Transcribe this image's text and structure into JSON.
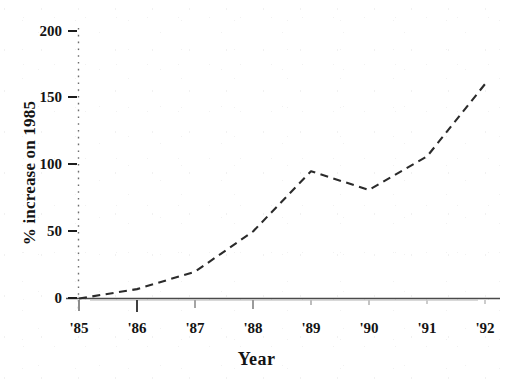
{
  "chart_data": {
    "type": "line",
    "title": "",
    "xlabel": "Year",
    "ylabel": "% increase on 1985",
    "categories": [
      "'85",
      "'86",
      "'87",
      "'88",
      "'89",
      "'90",
      "'91",
      "'92"
    ],
    "values": [
      0,
      7,
      20,
      50,
      95,
      81,
      106,
      160
    ],
    "series": [
      {
        "name": "% increase on 1985",
        "values": [
          0,
          7,
          20,
          50,
          95,
          81,
          106,
          160
        ],
        "line_style": "dashed",
        "color": "#2b2b2b"
      }
    ],
    "xlim": [
      "'85",
      "'92"
    ],
    "ylim": [
      0,
      200
    ],
    "yticks": [
      0,
      50,
      100,
      150,
      200
    ],
    "ytick_labels": [
      "0",
      "50",
      "100",
      "150",
      "200"
    ],
    "xticks": [
      "'85",
      "'86",
      "'87",
      "'88",
      "'89",
      "'90",
      "'91",
      "'92"
    ],
    "grid": false,
    "legend": "none",
    "y_axis_style": "dotted",
    "x_axis_style": "solid",
    "annotations": []
  },
  "axes": {
    "y_title": "% increase on 1985",
    "x_title": "Year",
    "y_tick_labels": [
      "200",
      "150",
      "100",
      "50",
      "0"
    ],
    "x_tick_labels": [
      "'85",
      "'86",
      "'87",
      "'88",
      "'89",
      "'90",
      "'91",
      "'92"
    ]
  },
  "colors": {
    "ink": "#1d1d1d",
    "line": "#2b2b2b",
    "axis": "#5a5a5a",
    "background": "#ffffff"
  }
}
